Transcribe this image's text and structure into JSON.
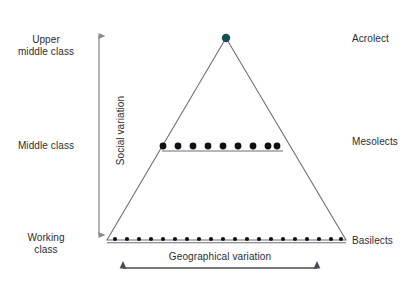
{
  "figure": {
    "background_color": "#ffffff",
    "line_color": "#6b6b78",
    "axis_color": "#8a8a95",
    "text_color": "#2b2b33",
    "dot_color": "#111111",
    "apex_dot_color": "#14504d"
  },
  "axes": {
    "y_label": "Social variation",
    "x_label": "Geographical variation",
    "y_arrow": "double-headed",
    "x_arrow": "double-headed"
  },
  "social_classes": [
    {
      "id": "upper-middle-class",
      "label": "Upper\nmiddle class",
      "y": 34
    },
    {
      "id": "middle-class",
      "label": "Middle class",
      "y": 140
    },
    {
      "id": "working-class",
      "label": "Working\nclass",
      "y": 232
    }
  ],
  "lect_labels": [
    {
      "id": "acrolect",
      "label": "Acrolect",
      "y": 33
    },
    {
      "id": "mesolects",
      "label": "Mesolects",
      "y": 136
    },
    {
      "id": "basilects",
      "label": "Basilects",
      "y": 235
    }
  ],
  "chart_data": {
    "type": "diagram",
    "xlabel": "Geographical variation",
    "ylabel": "Social variation",
    "triangle": {
      "apex": [
        226,
        38
      ],
      "base_left": [
        107,
        240
      ],
      "base_right": [
        346,
        240
      ]
    },
    "levels": [
      {
        "name": "Acrolect",
        "social_class": "Upper middle class",
        "y": 38,
        "dot_count": 1,
        "dot_radius": 4.2,
        "dots_x": [
          226
        ],
        "has_line": false
      },
      {
        "name": "Mesolects",
        "social_class": "Middle class",
        "y": 146,
        "dot_count": 9,
        "dot_radius": 3.4,
        "dots_x": [
          163,
          178,
          193,
          208,
          223,
          238,
          253,
          268,
          277
        ],
        "has_line": true,
        "line_x1": 162,
        "line_x2": 283
      },
      {
        "name": "Basilects",
        "social_class": "Working class",
        "y": 239,
        "dot_count": 20,
        "dot_radius": 2.1,
        "dots_x": [
          115,
          127,
          139,
          151,
          163,
          175,
          187,
          199,
          211,
          223,
          235,
          247,
          259,
          271,
          283,
          295,
          307,
          319,
          331,
          341
        ],
        "has_line": true,
        "line_x1": 107,
        "line_x2": 346
      }
    ],
    "y_axis": {
      "x": 99,
      "y_top": 30,
      "y_bottom": 241,
      "arrow": "both"
    },
    "x_axis": {
      "y": 268,
      "x_left": 117,
      "x_right": 323,
      "arrow": "both"
    },
    "grid": false,
    "legend": "none"
  }
}
